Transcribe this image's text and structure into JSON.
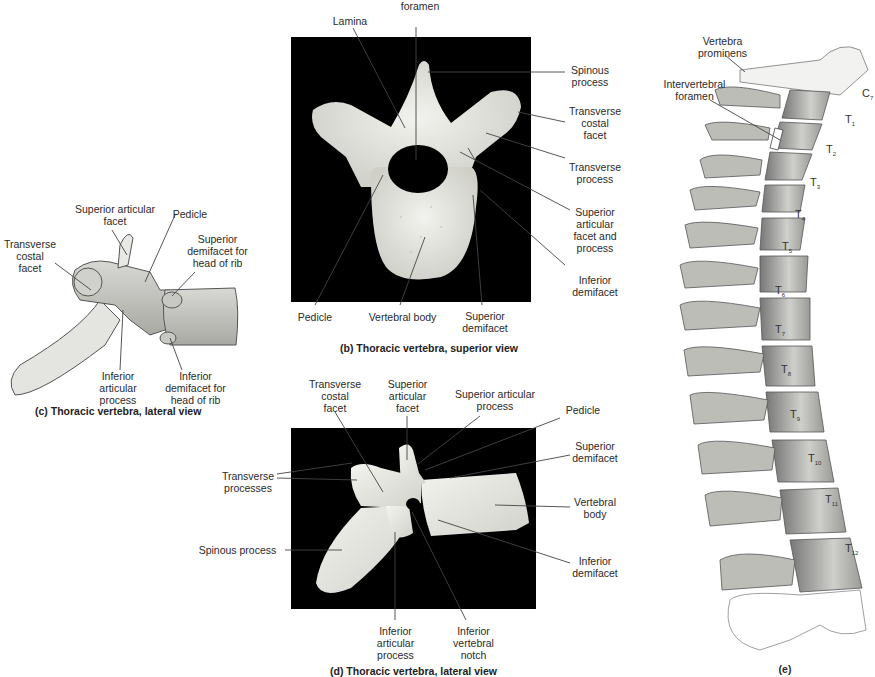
{
  "panel_b": {
    "caption": "(b) Thoracic vertebra, superior view",
    "labels": {
      "vertebral_foramen": "foramen",
      "lamina": "Lamina",
      "spinous_process": "Spinous\nprocess",
      "transverse_costal_facet": "Transverse\ncostal\nfacet",
      "transverse_process": "Transverse\nprocess",
      "superior_articular_facet_process": "Superior\narticular\nfacet and\nprocess",
      "inferior_demifacet": "Inferior\ndemifacet",
      "pedicle": "Pedicle",
      "vertebral_body": "Vertebral body",
      "superior_demifacet": "Superior\ndemifacet"
    }
  },
  "panel_c": {
    "caption": "(c) Thoracic vertebra, lateral view",
    "labels": {
      "superior_articular_facet": "Superior articular\nfacet",
      "pedicle": "Pedicle",
      "transverse_costal_facet": "Transverse\ncostal\nfacet",
      "superior_demifacet": "Superior\ndemifacet for\nhead of rib",
      "inferior_articular_process": "Inferior\narticular\nprocess",
      "inferior_demifacet": "Inferior\ndemifacet for\nhead of rib"
    }
  },
  "panel_d": {
    "caption": "(d) Thoracic vertebra, lateral view",
    "labels": {
      "transverse_costal_facet": "Transverse\ncostal\nfacet",
      "superior_articular_facet": "Superior\narticular\nfacet",
      "superior_articular_process": "Superior articular\nprocess",
      "pedicle": "Pedicle",
      "superior_demifacet": "Superior\ndemifacet",
      "transverse_processes": "Transverse\nprocesses",
      "vertebral_body": "Vertebral\nbody",
      "spinous_process": "Spinous process",
      "inferior_demifacet": "Inferior\ndemifacet",
      "inferior_articular_process": "Inferior\narticular\nprocess",
      "inferior_vertebral_notch": "Inferior\nvertebral\nnotch"
    }
  },
  "panel_e": {
    "caption": "(e)",
    "labels": {
      "vertebra_prominens": "Vertebra\nprominens",
      "intervertebral_foramen": "Intervertebral\nforamen"
    },
    "vertebra_levels": [
      {
        "letter": "C",
        "sub": "7"
      },
      {
        "letter": "T",
        "sub": "1"
      },
      {
        "letter": "T",
        "sub": "2"
      },
      {
        "letter": "T",
        "sub": "3"
      },
      {
        "letter": "T",
        "sub": "4"
      },
      {
        "letter": "T",
        "sub": "5"
      },
      {
        "letter": "T",
        "sub": "6"
      },
      {
        "letter": "T",
        "sub": "7"
      },
      {
        "letter": "T",
        "sub": "8"
      },
      {
        "letter": "T",
        "sub": "9"
      },
      {
        "letter": "T",
        "sub": "10"
      },
      {
        "letter": "T",
        "sub": "11"
      },
      {
        "letter": "T",
        "sub": "12"
      }
    ]
  }
}
